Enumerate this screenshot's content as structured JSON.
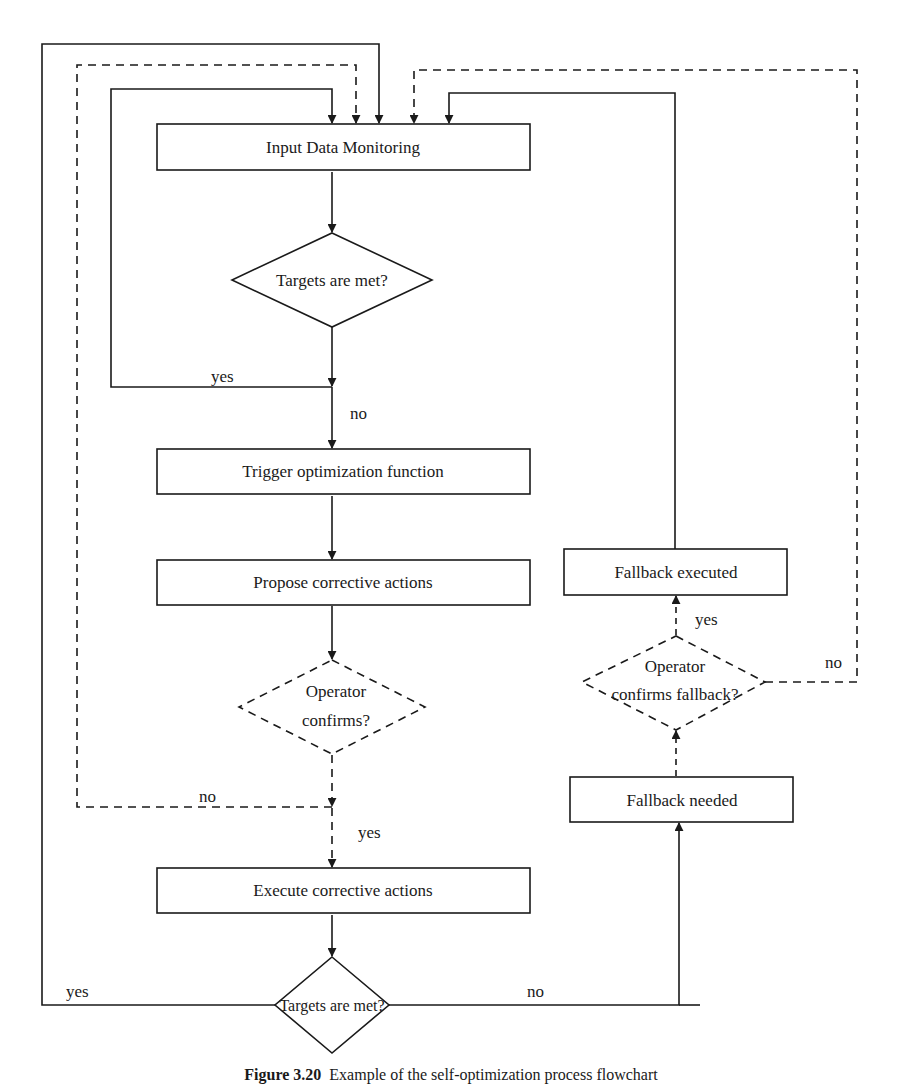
{
  "diagram": {
    "nodes": {
      "input_monitoring": {
        "label": "Input Data Monitoring",
        "shape": "rect",
        "style": "solid"
      },
      "targets_met_1": {
        "label": "Targets are met?",
        "shape": "diamond",
        "style": "solid"
      },
      "trigger_optimization": {
        "label": "Trigger optimization function",
        "shape": "rect",
        "style": "solid"
      },
      "propose_actions": {
        "label": "Propose corrective actions",
        "shape": "rect",
        "style": "solid"
      },
      "operator_confirms": {
        "label_line1": "Operator",
        "label_line2": "confirms?",
        "shape": "diamond",
        "style": "dashed"
      },
      "execute_actions": {
        "label": "Execute corrective actions",
        "shape": "rect",
        "style": "solid"
      },
      "targets_met_2": {
        "label": "Targets are met?",
        "shape": "diamond",
        "style": "solid"
      },
      "fallback_needed": {
        "label": "Fallback needed",
        "shape": "rect",
        "style": "solid"
      },
      "operator_confirms_fallback": {
        "label_line1": "Operator",
        "label_line2": "confirms fallback?",
        "shape": "diamond",
        "style": "dashed"
      },
      "fallback_executed": {
        "label": "Fallback executed",
        "shape": "rect",
        "style": "solid"
      }
    },
    "edge_labels": {
      "d1_yes": "yes",
      "d1_no": "no",
      "d2_no": "no",
      "d2_yes": "yes",
      "d3_yes": "yes",
      "d3_no": "no",
      "d4_yes": "yes",
      "d4_no": "no"
    },
    "edges": [
      {
        "from": "input_monitoring",
        "to": "targets_met_1",
        "style": "solid"
      },
      {
        "from": "targets_met_1",
        "to": "input_monitoring",
        "label": "yes",
        "style": "solid"
      },
      {
        "from": "targets_met_1",
        "to": "trigger_optimization",
        "label": "no",
        "style": "solid"
      },
      {
        "from": "trigger_optimization",
        "to": "propose_actions",
        "style": "solid"
      },
      {
        "from": "propose_actions",
        "to": "operator_confirms",
        "style": "solid"
      },
      {
        "from": "operator_confirms",
        "to": "input_monitoring",
        "label": "no",
        "style": "dashed"
      },
      {
        "from": "operator_confirms",
        "to": "execute_actions",
        "label": "yes",
        "style": "dashed"
      },
      {
        "from": "execute_actions",
        "to": "targets_met_2",
        "style": "solid"
      },
      {
        "from": "targets_met_2",
        "to": "input_monitoring",
        "label": "yes",
        "style": "solid"
      },
      {
        "from": "targets_met_2",
        "to": "fallback_needed",
        "label": "no",
        "style": "solid"
      },
      {
        "from": "fallback_needed",
        "to": "operator_confirms_fallback",
        "style": "dashed"
      },
      {
        "from": "operator_confirms_fallback",
        "to": "fallback_executed",
        "label": "yes",
        "style": "dashed"
      },
      {
        "from": "operator_confirms_fallback",
        "to": "input_monitoring",
        "label": "no",
        "style": "dashed"
      },
      {
        "from": "fallback_executed",
        "to": "input_monitoring",
        "style": "solid"
      }
    ],
    "colors": {
      "stroke": "#1a1a1a",
      "background": "#ffffff"
    }
  },
  "caption": {
    "figure_number": "Figure 3.20",
    "text": "Example of the self-optimization process flowchart"
  }
}
